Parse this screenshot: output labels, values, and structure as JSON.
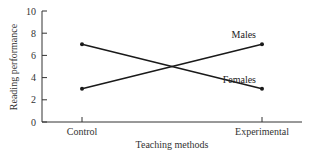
{
  "chart_data": {
    "type": "line",
    "title": "",
    "xlabel": "Teaching methods",
    "ylabel": "Reading performance",
    "categories": [
      "Control",
      "Experimental"
    ],
    "ylim": [
      0,
      10
    ],
    "yticks": [
      0,
      2,
      4,
      6,
      8,
      10
    ],
    "grid": false,
    "legend": "inline labels near line ends",
    "series": [
      {
        "name": "Males",
        "values": [
          3,
          7
        ]
      },
      {
        "name": "Females",
        "values": [
          7,
          3
        ]
      }
    ]
  },
  "colors": {
    "line": "#1a1a1a",
    "axis": "#333333",
    "text": "#333333"
  }
}
